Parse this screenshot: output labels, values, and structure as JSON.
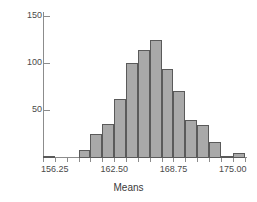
{
  "chart_data": {
    "type": "bar",
    "title": "",
    "subtitle": "",
    "xlabel": "Means",
    "ylabel": "",
    "grid": false,
    "legend": null,
    "xlim": [
      155.0,
      176.5
    ],
    "ylim": [
      0,
      155
    ],
    "xticks": [
      156.25,
      162.5,
      168.75,
      175.0
    ],
    "xtick_labels": [
      "156.25",
      "162.50",
      "168.75",
      "175.00"
    ],
    "yticks": [
      50,
      100,
      150
    ],
    "ytick_labels": [
      "50",
      "100",
      "150"
    ],
    "bin_width": 1.25,
    "bar_color": "#a9a9a9",
    "bar_edge_color": "#5a5a5a",
    "axis_color": "#8c8c8c",
    "bins": [
      {
        "left": 155.0,
        "right": 156.25,
        "value": 1
      },
      {
        "left": 156.25,
        "right": 157.5,
        "value": 0
      },
      {
        "left": 157.5,
        "right": 158.75,
        "value": 0
      },
      {
        "left": 158.75,
        "right": 160.0,
        "value": 8
      },
      {
        "left": 160.0,
        "right": 161.25,
        "value": 25
      },
      {
        "left": 161.25,
        "right": 162.5,
        "value": 36
      },
      {
        "left": 162.5,
        "right": 163.75,
        "value": 63
      },
      {
        "left": 163.75,
        "right": 165.0,
        "value": 101
      },
      {
        "left": 165.0,
        "right": 166.25,
        "value": 115
      },
      {
        "left": 166.25,
        "right": 167.5,
        "value": 125
      },
      {
        "left": 167.5,
        "right": 168.75,
        "value": 94
      },
      {
        "left": 168.75,
        "right": 170.0,
        "value": 71
      },
      {
        "left": 170.0,
        "right": 171.25,
        "value": 40
      },
      {
        "left": 171.25,
        "right": 172.5,
        "value": 35
      },
      {
        "left": 172.5,
        "right": 173.75,
        "value": 17
      },
      {
        "left": 173.75,
        "right": 175.0,
        "value": 2
      },
      {
        "left": 175.0,
        "right": 176.25,
        "value": 5
      }
    ]
  }
}
